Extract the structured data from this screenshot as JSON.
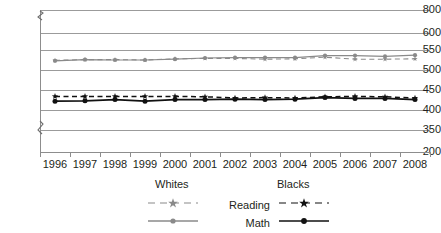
{
  "chart_data": {
    "type": "line",
    "title": "",
    "subtitle": "",
    "xlabel": "",
    "ylabel": "",
    "grid": true,
    "legend_position": "bottom",
    "x": [
      1996,
      1997,
      1998,
      1999,
      2000,
      2001,
      2002,
      2003,
      2004,
      2005,
      2006,
      2007,
      2008
    ],
    "categories": [
      "1996",
      "1997",
      "1998",
      "1999",
      "2000",
      "2001",
      "2002",
      "2003",
      "2004",
      "2005",
      "2006",
      "2007",
      "2008"
    ],
    "ylim": [
      200,
      800
    ],
    "y_ticks": [
      200,
      350,
      400,
      450,
      500,
      550,
      600,
      800
    ],
    "y_tick_labels": [
      "200",
      "350",
      "400",
      "450",
      "500",
      "550",
      "600",
      "800"
    ],
    "axis_breaks": [
      "between 200 and 350",
      "between 600 and 800"
    ],
    "series": [
      {
        "name": "Reading",
        "group": "Whites",
        "legend_label": "Reading",
        "color": "#8a8a8a",
        "line_style": "dashed",
        "marker": "star",
        "values": [
          524,
          526,
          526,
          525,
          528,
          529,
          529,
          527,
          528,
          532,
          527,
          527,
          528
        ]
      },
      {
        "name": "Math",
        "group": "Whites",
        "legend_label": "Math",
        "color": "#8a8a8a",
        "line_style": "solid",
        "marker": "circle",
        "values": [
          523,
          526,
          525,
          525,
          527,
          530,
          531,
          531,
          531,
          536,
          536,
          534,
          537
        ]
      },
      {
        "name": "Reading",
        "group": "Blacks",
        "legend_label": "Reading",
        "color": "#111111",
        "line_style": "dashed",
        "marker": "star",
        "values": [
          434,
          434,
          434,
          434,
          434,
          433,
          430,
          431,
          430,
          433,
          434,
          433,
          430
        ]
      },
      {
        "name": "Math",
        "group": "Blacks",
        "legend_label": "Math",
        "color": "#111111",
        "line_style": "solid",
        "marker": "circle",
        "values": [
          422,
          423,
          426,
          422,
          426,
          426,
          427,
          426,
          427,
          431,
          429,
          429,
          426
        ]
      }
    ]
  },
  "axis": {
    "y_labels": [
      "800",
      "600",
      "550",
      "500",
      "450",
      "400",
      "350",
      "200"
    ],
    "x_labels": [
      "1996",
      "1997",
      "1998",
      "1999",
      "2000",
      "2001",
      "2002",
      "2003",
      "2004",
      "2005",
      "2006",
      "2007",
      "2008"
    ]
  },
  "legend": {
    "group_whites": "Whites",
    "group_blacks": "Blacks",
    "row_reading": "Reading",
    "row_math": "Math"
  },
  "colors": {
    "whites": "#8a8a8a",
    "blacks": "#111111",
    "grid": "#9b9b9b",
    "axis": "#8d8d8d",
    "text": "#231f20",
    "background": "#ffffff"
  }
}
